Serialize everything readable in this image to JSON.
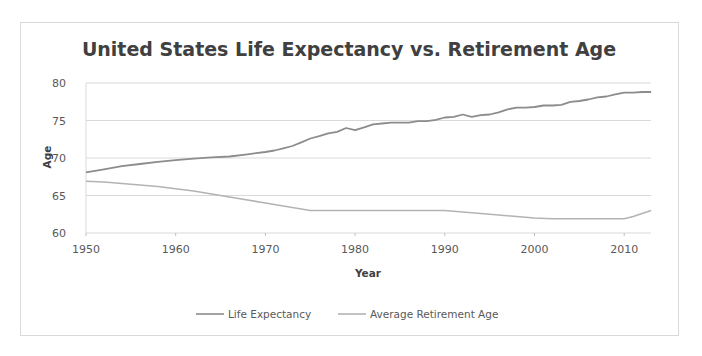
{
  "chart_data": {
    "type": "line",
    "title": "United States Life Expectancy vs. Retirement Age",
    "xlabel": "Year",
    "ylabel": "Age",
    "xlim": [
      1950,
      2013
    ],
    "ylim": [
      60,
      80
    ],
    "x_ticks": [
      1950,
      1960,
      1970,
      1980,
      1990,
      2000,
      2010
    ],
    "y_ticks": [
      60,
      65,
      70,
      75,
      80
    ],
    "grid": {
      "horizontal": true,
      "vertical": false
    },
    "legend_position": "bottom",
    "series": [
      {
        "name": "Life Expectancy",
        "color": "#8c8c8c",
        "points": [
          [
            1950,
            68.1
          ],
          [
            1952,
            68.5
          ],
          [
            1954,
            68.9
          ],
          [
            1956,
            69.2
          ],
          [
            1958,
            69.5
          ],
          [
            1960,
            69.7
          ],
          [
            1962,
            69.9
          ],
          [
            1964,
            70.1
          ],
          [
            1966,
            70.2
          ],
          [
            1968,
            70.5
          ],
          [
            1970,
            70.8
          ],
          [
            1971,
            71.0
          ],
          [
            1972,
            71.3
          ],
          [
            1973,
            71.6
          ],
          [
            1974,
            72.1
          ],
          [
            1975,
            72.6
          ],
          [
            1976,
            72.9
          ],
          [
            1977,
            73.3
          ],
          [
            1978,
            73.5
          ],
          [
            1979,
            74.0
          ],
          [
            1980,
            73.7
          ],
          [
            1981,
            74.1
          ],
          [
            1982,
            74.5
          ],
          [
            1983,
            74.6
          ],
          [
            1984,
            74.7
          ],
          [
            1985,
            74.7
          ],
          [
            1986,
            74.7
          ],
          [
            1987,
            74.9
          ],
          [
            1988,
            74.9
          ],
          [
            1989,
            75.1
          ],
          [
            1990,
            75.4
          ],
          [
            1991,
            75.5
          ],
          [
            1992,
            75.8
          ],
          [
            1993,
            75.5
          ],
          [
            1994,
            75.7
          ],
          [
            1995,
            75.8
          ],
          [
            1996,
            76.1
          ],
          [
            1997,
            76.5
          ],
          [
            1998,
            76.7
          ],
          [
            1999,
            76.7
          ],
          [
            2000,
            76.8
          ],
          [
            2001,
            77.0
          ],
          [
            2002,
            77.0
          ],
          [
            2003,
            77.1
          ],
          [
            2004,
            77.5
          ],
          [
            2005,
            77.6
          ],
          [
            2006,
            77.8
          ],
          [
            2007,
            78.1
          ],
          [
            2008,
            78.2
          ],
          [
            2009,
            78.5
          ],
          [
            2010,
            78.7
          ],
          [
            2011,
            78.7
          ],
          [
            2012,
            78.8
          ],
          [
            2013,
            78.8
          ]
        ]
      },
      {
        "name": "Average Retirement Age",
        "color": "#b3b3b3",
        "points": [
          [
            1950,
            66.9
          ],
          [
            1952,
            66.8
          ],
          [
            1954,
            66.6
          ],
          [
            1956,
            66.4
          ],
          [
            1958,
            66.2
          ],
          [
            1960,
            65.9
          ],
          [
            1962,
            65.6
          ],
          [
            1964,
            65.2
          ],
          [
            1966,
            64.8
          ],
          [
            1968,
            64.4
          ],
          [
            1970,
            64.0
          ],
          [
            1972,
            63.6
          ],
          [
            1974,
            63.2
          ],
          [
            1975,
            63.0
          ],
          [
            1978,
            63.0
          ],
          [
            1980,
            63.0
          ],
          [
            1985,
            63.0
          ],
          [
            1990,
            63.0
          ],
          [
            1992,
            62.8
          ],
          [
            1994,
            62.6
          ],
          [
            1996,
            62.4
          ],
          [
            1998,
            62.2
          ],
          [
            2000,
            62.0
          ],
          [
            2002,
            61.9
          ],
          [
            2004,
            61.9
          ],
          [
            2006,
            61.9
          ],
          [
            2008,
            61.9
          ],
          [
            2010,
            61.9
          ],
          [
            2011,
            62.2
          ],
          [
            2012,
            62.6
          ],
          [
            2013,
            63.0
          ]
        ]
      }
    ]
  },
  "legend": {
    "items": [
      {
        "label": "Life Expectancy",
        "color": "#8c8c8c"
      },
      {
        "label": "Average Retirement Age",
        "color": "#b3b3b3"
      }
    ]
  },
  "colors": {
    "gridline": "#d9d9d9",
    "frame_border": "#d9d9d9",
    "title_text": "#404040",
    "tick_text": "#595959"
  }
}
